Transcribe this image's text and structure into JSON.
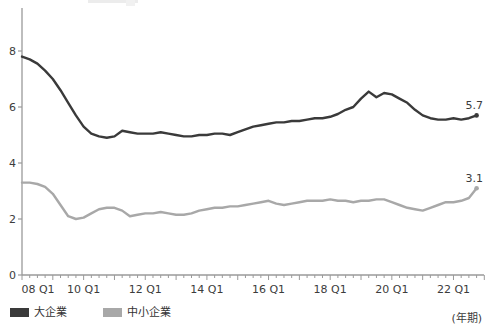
{
  "chart_data": {
    "type": "line",
    "title": "",
    "xlabel_note": "(年期)",
    "ylim": [
      0,
      8
    ],
    "yticks": [
      0,
      2,
      4,
      6,
      8
    ],
    "grid": false,
    "legend_position": "bottom-left",
    "x_tick_labels_visible": [
      "08 Q1",
      "10 Q1",
      "12 Q1",
      "14 Q1",
      "16 Q1",
      "18 Q1",
      "20 Q1",
      "22 Q1"
    ],
    "categories": [
      "08Q1",
      "08Q2",
      "08Q3",
      "08Q4",
      "09Q1",
      "09Q2",
      "09Q3",
      "09Q4",
      "10Q1",
      "10Q2",
      "10Q3",
      "10Q4",
      "11Q1",
      "11Q2",
      "11Q3",
      "11Q4",
      "12Q1",
      "12Q2",
      "12Q3",
      "12Q4",
      "13Q1",
      "13Q2",
      "13Q3",
      "13Q4",
      "14Q1",
      "14Q2",
      "14Q3",
      "14Q4",
      "15Q1",
      "15Q2",
      "15Q3",
      "15Q4",
      "16Q1",
      "16Q2",
      "16Q3",
      "16Q4",
      "17Q1",
      "17Q2",
      "17Q3",
      "17Q4",
      "18Q1",
      "18Q2",
      "18Q3",
      "18Q4",
      "19Q1",
      "19Q2",
      "19Q3",
      "19Q4",
      "20Q1",
      "20Q2",
      "20Q3",
      "20Q4",
      "21Q1",
      "21Q2",
      "21Q3",
      "21Q4",
      "22Q1",
      "22Q2",
      "22Q3",
      "22Q4"
    ],
    "series": [
      {
        "name": "大企業",
        "color": "#3a3a3a",
        "end_label": "5.7",
        "values": [
          7.8,
          7.7,
          7.55,
          7.3,
          7.0,
          6.6,
          6.15,
          5.7,
          5.3,
          5.05,
          4.95,
          4.9,
          4.95,
          5.15,
          5.1,
          5.05,
          5.05,
          5.05,
          5.1,
          5.05,
          5.0,
          4.95,
          4.95,
          5.0,
          5.0,
          5.05,
          5.05,
          5.0,
          5.1,
          5.2,
          5.3,
          5.35,
          5.4,
          5.45,
          5.45,
          5.5,
          5.5,
          5.55,
          5.6,
          5.6,
          5.65,
          5.75,
          5.9,
          6.0,
          6.3,
          6.55,
          6.35,
          6.5,
          6.45,
          6.3,
          6.15,
          5.9,
          5.7,
          5.6,
          5.55,
          5.55,
          5.6,
          5.55,
          5.6,
          5.7
        ]
      },
      {
        "name": "中小企業",
        "color": "#a8a8a8",
        "end_label": "3.1",
        "values": [
          3.3,
          3.3,
          3.25,
          3.15,
          2.9,
          2.5,
          2.1,
          2.0,
          2.05,
          2.2,
          2.35,
          2.4,
          2.4,
          2.3,
          2.1,
          2.15,
          2.2,
          2.2,
          2.25,
          2.2,
          2.15,
          2.15,
          2.2,
          2.3,
          2.35,
          2.4,
          2.4,
          2.45,
          2.45,
          2.5,
          2.55,
          2.6,
          2.65,
          2.55,
          2.5,
          2.55,
          2.6,
          2.65,
          2.65,
          2.65,
          2.7,
          2.65,
          2.65,
          2.6,
          2.65,
          2.65,
          2.7,
          2.7,
          2.6,
          2.5,
          2.4,
          2.35,
          2.3,
          2.4,
          2.5,
          2.6,
          2.6,
          2.65,
          2.75,
          3.1
        ]
      }
    ]
  },
  "legend": {
    "items": [
      {
        "label": "大企業",
        "color": "#3a3a3a"
      },
      {
        "label": "中小企業",
        "color": "#a8a8a8"
      }
    ]
  },
  "axis_note": "(年期)",
  "colors": {
    "axis_line": "#9a9a9a",
    "tick_text": "#3c3c3c",
    "end_label_text": "#3c3c3c"
  }
}
